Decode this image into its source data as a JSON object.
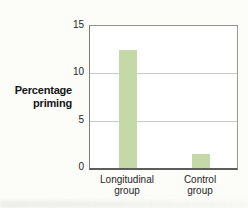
{
  "colors": {
    "background": "#fcfcf9",
    "plot_background": "#ffffff",
    "bar": "#c4d8a8",
    "grid": "#c9c9c9",
    "axis": "#919191",
    "baseline": "#5c5c5c",
    "text": "#262626"
  },
  "y_axis": {
    "label_lines": [
      "Percentage",
      "priming"
    ],
    "ticks": [
      0,
      5,
      10,
      15
    ]
  },
  "chart_data": {
    "type": "bar",
    "categories": [
      "Longitudinal group",
      "Control group"
    ],
    "values": [
      12.5,
      1.5
    ],
    "title": "",
    "xlabel": "",
    "ylabel": "Percentage priming",
    "ylim": [
      0,
      15
    ],
    "grid": true,
    "legend": "none",
    "bar_color": "#c4d8a8"
  }
}
